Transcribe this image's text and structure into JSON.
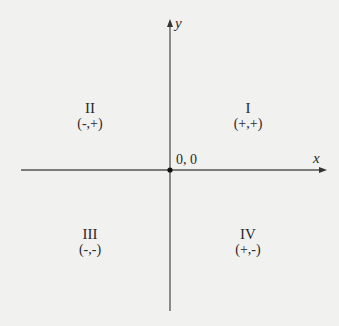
{
  "diagram": {
    "axes": {
      "x_label": "x",
      "y_label": "y",
      "origin_label": "0, 0"
    },
    "quadrants": [
      {
        "numeral": "I",
        "signs": "(+,+)"
      },
      {
        "numeral": "II",
        "signs": "(-,+)"
      },
      {
        "numeral": "III",
        "signs": "(-,-)"
      },
      {
        "numeral": "IV",
        "signs": "(+,-)"
      }
    ],
    "colors": {
      "background": "#f1f1f0",
      "axis": "#555555",
      "text": "#2a2a2a",
      "origin_dot": "#111111"
    }
  }
}
